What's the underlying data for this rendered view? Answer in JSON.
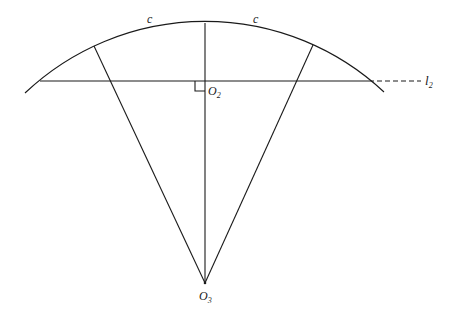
{
  "diagram": {
    "arc_labels": [
      "c",
      "c"
    ],
    "line_label": {
      "base": "l",
      "sub": "2"
    },
    "foot_label": {
      "base": "O",
      "sub": "2"
    },
    "center_label": {
      "base": "O",
      "sub": "3"
    },
    "colors": {
      "stroke": "#1a1a1a",
      "background": "#ffffff"
    }
  }
}
